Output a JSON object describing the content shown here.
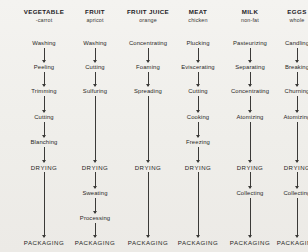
{
  "figure": {
    "type": "flowchart",
    "orientation": "vertical-columns",
    "background_color": "#f2f1ee",
    "line_color": "#3b3a38",
    "text_color": "#2b2b2b"
  },
  "columns": [
    {
      "id": "vegetable",
      "header_main": "VEGETABLE",
      "header_sub": "-carrot",
      "x_center": 44,
      "steps": [
        {
          "label": "Washing",
          "y": 40,
          "caps": false
        },
        {
          "label": "Peeling",
          "y": 64,
          "caps": false
        },
        {
          "label": "Trimming",
          "y": 88,
          "caps": false
        },
        {
          "label": "Cutting",
          "y": 114,
          "caps": false
        },
        {
          "label": "Blanching",
          "y": 139,
          "caps": false
        },
        {
          "label": "DRYING",
          "y": 164,
          "caps": true
        },
        {
          "label": "PACKAGING",
          "y": 239,
          "caps": true
        }
      ]
    },
    {
      "id": "fruit",
      "header_main": "FRUIT",
      "header_sub": "apricot",
      "x_center": 95,
      "steps": [
        {
          "label": "Washing",
          "y": 40,
          "caps": false
        },
        {
          "label": "Cutting",
          "y": 64,
          "caps": false
        },
        {
          "label": "Sulfuring",
          "y": 88,
          "caps": false
        },
        {
          "label": "DRYING",
          "y": 164,
          "caps": true
        },
        {
          "label": "Sweating",
          "y": 190,
          "caps": false
        },
        {
          "label": "Processing",
          "y": 215,
          "caps": false
        },
        {
          "label": "PACKAGING",
          "y": 239,
          "caps": true
        }
      ]
    },
    {
      "id": "fruit-juice",
      "header_main": "FRUIT JUICE",
      "header_sub": "orange",
      "x_center": 148,
      "steps": [
        {
          "label": "Concentrating",
          "y": 40,
          "caps": false
        },
        {
          "label": "Foaming",
          "y": 64,
          "caps": false
        },
        {
          "label": "Spreading",
          "y": 88,
          "caps": false
        },
        {
          "label": "DRYING",
          "y": 164,
          "caps": true
        },
        {
          "label": "PACKAGING",
          "y": 239,
          "caps": true
        }
      ]
    },
    {
      "id": "meat",
      "header_main": "MEAT",
      "header_sub": "chicken",
      "x_center": 198,
      "steps": [
        {
          "label": "Plucking",
          "y": 40,
          "caps": false
        },
        {
          "label": "Eviscerating",
          "y": 64,
          "caps": false
        },
        {
          "label": "Cutting",
          "y": 88,
          "caps": false
        },
        {
          "label": "Cooking",
          "y": 114,
          "caps": false
        },
        {
          "label": "Freezing",
          "y": 139,
          "caps": false
        },
        {
          "label": "DRYING",
          "y": 164,
          "caps": true
        },
        {
          "label": "PACKAGING",
          "y": 239,
          "caps": true
        }
      ]
    },
    {
      "id": "milk",
      "header_main": "MILK",
      "header_sub": "non-fat",
      "x_center": 250,
      "steps": [
        {
          "label": "Pasteurizing",
          "y": 40,
          "caps": false
        },
        {
          "label": "Separating",
          "y": 64,
          "caps": false
        },
        {
          "label": "Concentrating",
          "y": 88,
          "caps": false
        },
        {
          "label": "Atomizing",
          "y": 114,
          "caps": false
        },
        {
          "label": "DRYING",
          "y": 164,
          "caps": true
        },
        {
          "label": "Collecting",
          "y": 190,
          "caps": false
        },
        {
          "label": "PACKAGING",
          "y": 239,
          "caps": true
        }
      ]
    },
    {
      "id": "eggs",
      "header_main": "EGGS",
      "header_sub": "whole",
      "x_center": 297,
      "steps": [
        {
          "label": "Candling",
          "y": 40,
          "caps": false
        },
        {
          "label": "Breaking",
          "y": 64,
          "caps": false
        },
        {
          "label": "Churning",
          "y": 88,
          "caps": false
        },
        {
          "label": "Atomizing",
          "y": 114,
          "caps": false
        },
        {
          "label": "DRYING",
          "y": 164,
          "caps": true
        },
        {
          "label": "Collecting",
          "y": 190,
          "caps": false
        },
        {
          "label": "PACKAGING",
          "y": 239,
          "caps": true
        }
      ]
    }
  ]
}
